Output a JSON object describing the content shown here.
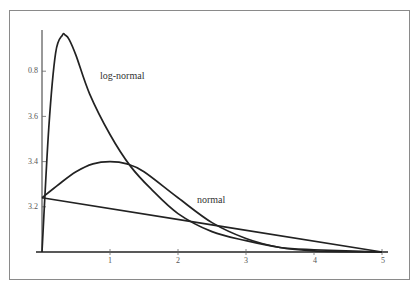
{
  "chart_data": {
    "type": "line",
    "title": "",
    "xlabel": "",
    "ylabel": "",
    "xlim": [
      0,
      5
    ],
    "ylim": [
      0,
      1.0
    ],
    "grid": false,
    "x_ticks": [
      "1",
      "2",
      "3",
      "4",
      "5"
    ],
    "y_ticks": [
      "0.8",
      "3.6",
      "3.4",
      "3.2"
    ],
    "annotations": [
      {
        "text": "log-normal",
        "x": 0.85,
        "y": 0.78
      },
      {
        "text": "normal",
        "x": 2.3,
        "y": 0.23
      }
    ],
    "series": [
      {
        "name": "log-normal",
        "x": [
          0,
          0.1,
          0.2,
          0.3,
          0.34,
          0.4,
          0.5,
          0.7,
          1.0,
          1.3,
          1.6,
          2.0,
          2.5,
          3.0,
          3.5,
          4.0,
          5.0
        ],
        "y": [
          0,
          0.55,
          0.88,
          0.96,
          0.96,
          0.94,
          0.87,
          0.7,
          0.52,
          0.38,
          0.28,
          0.17,
          0.09,
          0.05,
          0.02,
          0.01,
          0.0
        ]
      },
      {
        "name": "normal",
        "x": [
          0,
          0.25,
          0.5,
          0.75,
          1.0,
          1.25,
          1.5,
          2.0,
          2.5,
          3.0,
          3.5,
          4.0,
          5.0
        ],
        "y": [
          0.24,
          0.3,
          0.355,
          0.39,
          0.4,
          0.39,
          0.355,
          0.24,
          0.13,
          0.06,
          0.02,
          0.005,
          0.0
        ]
      },
      {
        "name": "exponential-line",
        "x": [
          0,
          5
        ],
        "y": [
          0.24,
          0.0
        ]
      }
    ]
  },
  "labels": {
    "lognormal": "log-normal",
    "normal": "normal"
  },
  "ticks": {
    "y": [
      "0.8",
      "3.6",
      "3.4",
      "3.2"
    ],
    "x": [
      "1",
      "2",
      "3",
      "4",
      "5"
    ]
  }
}
